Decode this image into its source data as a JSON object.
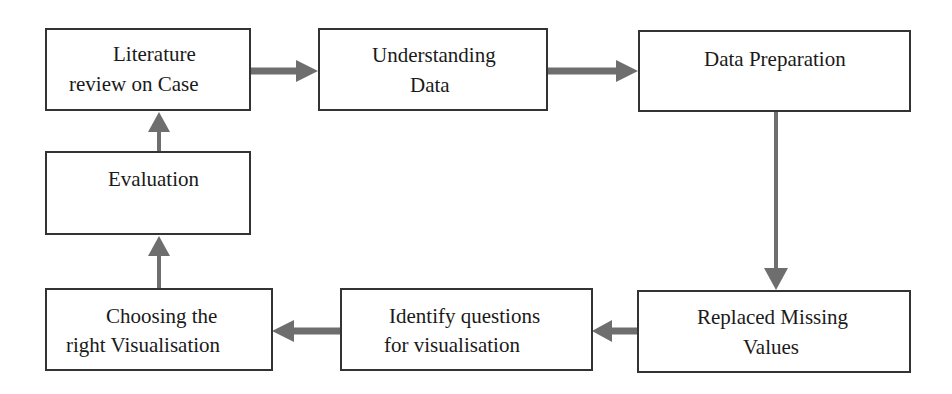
{
  "diagram": {
    "type": "flowchart",
    "nodes": [
      {
        "id": "literature",
        "line1": "Literature",
        "line2": "review on Case"
      },
      {
        "id": "understanding",
        "line1": "Understanding",
        "line2": "Data"
      },
      {
        "id": "preparation",
        "line1": "Data Preparation",
        "line2": ""
      },
      {
        "id": "missing",
        "line1": "Replaced Missing",
        "line2": "Values"
      },
      {
        "id": "questions",
        "line1": "Identify questions",
        "line2": "for visualisation"
      },
      {
        "id": "choosing",
        "line1": "Choosing the",
        "line2": "right Visualisation"
      },
      {
        "id": "evaluation",
        "line1": "Evaluation",
        "line2": ""
      }
    ],
    "edges": [
      {
        "from": "literature",
        "to": "understanding"
      },
      {
        "from": "understanding",
        "to": "preparation"
      },
      {
        "from": "preparation",
        "to": "missing"
      },
      {
        "from": "missing",
        "to": "questions"
      },
      {
        "from": "questions",
        "to": "choosing"
      },
      {
        "from": "choosing",
        "to": "evaluation"
      },
      {
        "from": "evaluation",
        "to": "literature"
      }
    ],
    "colors": {
      "arrow": "#6e6e6e",
      "border": "#333333"
    }
  }
}
